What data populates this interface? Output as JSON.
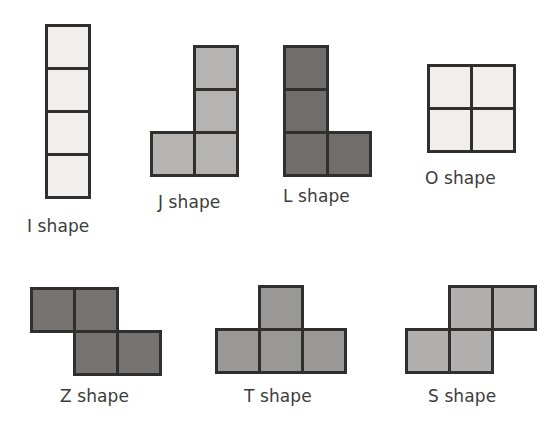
{
  "figure": {
    "background_color": "#ffffff",
    "width": 560,
    "height": 435,
    "border_color": "#2f2f2f",
    "label_color": "#3c3c3c",
    "cell_size": 43
  },
  "shapes": [
    {
      "id": "i-shape",
      "letter": "I",
      "label": "I shape",
      "fill_color": "#f0efee",
      "label_x": 27,
      "label_y": 218,
      "origin_x": 45,
      "origin_y": 24,
      "cols": 1,
      "rows": 4,
      "cells": [
        [
          0,
          0
        ],
        [
          0,
          1
        ],
        [
          0,
          2
        ],
        [
          0,
          3
        ]
      ]
    },
    {
      "id": "j-shape",
      "letter": "J",
      "label": "J shape",
      "fill_color": "#b5b4b2",
      "label_x": 158,
      "label_y": 194,
      "origin_x": 150,
      "origin_y": 45,
      "cols": 2,
      "rows": 3,
      "cells": [
        [
          1,
          0
        ],
        [
          1,
          1
        ],
        [
          0,
          2
        ],
        [
          1,
          2
        ]
      ]
    },
    {
      "id": "l-shape",
      "letter": "L",
      "label": "L shape",
      "fill_color": "#6f6e6d",
      "label_x": 283,
      "label_y": 188,
      "origin_x": 283,
      "origin_y": 45,
      "cols": 2,
      "rows": 3,
      "cells": [
        [
          0,
          0
        ],
        [
          0,
          1
        ],
        [
          0,
          2
        ],
        [
          1,
          2
        ]
      ]
    },
    {
      "id": "o-shape",
      "letter": "O",
      "label": "O shape",
      "fill_color": "#f0efee",
      "label_x": 425,
      "label_y": 170,
      "origin_x": 427,
      "origin_y": 64,
      "cols": 2,
      "rows": 2,
      "cells": [
        [
          0,
          0
        ],
        [
          1,
          0
        ],
        [
          0,
          1
        ],
        [
          1,
          1
        ]
      ]
    },
    {
      "id": "z-shape",
      "letter": "Z",
      "label": "Z shape",
      "fill_color": "#757473",
      "label_x": 60,
      "label_y": 388,
      "origin_x": 30,
      "origin_y": 287,
      "cols": 3,
      "rows": 2,
      "cells": [
        [
          0,
          0
        ],
        [
          1,
          0
        ],
        [
          1,
          1
        ],
        [
          2,
          1
        ]
      ]
    },
    {
      "id": "t-shape",
      "letter": "T",
      "label": "T shape",
      "fill_color": "#9a9998",
      "label_x": 244,
      "label_y": 388,
      "origin_x": 215,
      "origin_y": 285,
      "cols": 3,
      "rows": 2,
      "cells": [
        [
          1,
          0
        ],
        [
          0,
          1
        ],
        [
          1,
          1
        ],
        [
          2,
          1
        ]
      ]
    },
    {
      "id": "s-shape",
      "letter": "S",
      "label": "S shape",
      "fill_color": "#b1b0ae",
      "label_x": 428,
      "label_y": 388,
      "origin_x": 405,
      "origin_y": 285,
      "cols": 3,
      "rows": 2,
      "cells": [
        [
          1,
          0
        ],
        [
          2,
          0
        ],
        [
          0,
          1
        ],
        [
          1,
          1
        ]
      ]
    }
  ]
}
